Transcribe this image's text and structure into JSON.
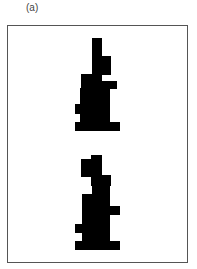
{
  "figure": {
    "panel_label": "(a)",
    "frame_color": "#555555",
    "shape_color": "#000000",
    "background_color": "#ffffff"
  },
  "shapes": [
    {
      "name": "upper-silhouette",
      "blocks": [
        {
          "x": 92,
          "y": 38,
          "w": 10,
          "h": 19
        },
        {
          "x": 92,
          "y": 56,
          "w": 19,
          "h": 19
        },
        {
          "x": 81,
          "y": 74,
          "w": 21,
          "h": 8
        },
        {
          "x": 81,
          "y": 81,
          "w": 36,
          "h": 8
        },
        {
          "x": 80,
          "y": 88,
          "w": 30,
          "h": 17
        },
        {
          "x": 75,
          "y": 104,
          "w": 35,
          "h": 10
        },
        {
          "x": 80,
          "y": 113,
          "w": 30,
          "h": 10
        },
        {
          "x": 75,
          "y": 122,
          "w": 45,
          "h": 9
        }
      ]
    },
    {
      "name": "lower-silhouette",
      "blocks": [
        {
          "x": 91,
          "y": 155,
          "w": 11,
          "h": 5
        },
        {
          "x": 81,
          "y": 159,
          "w": 21,
          "h": 18
        },
        {
          "x": 91,
          "y": 175,
          "w": 20,
          "h": 11
        },
        {
          "x": 92,
          "y": 185,
          "w": 18,
          "h": 10
        },
        {
          "x": 82,
          "y": 194,
          "w": 28,
          "h": 13
        },
        {
          "x": 82,
          "y": 206,
          "w": 38,
          "h": 9
        },
        {
          "x": 82,
          "y": 214,
          "w": 28,
          "h": 11
        },
        {
          "x": 75,
          "y": 224,
          "w": 35,
          "h": 9
        },
        {
          "x": 82,
          "y": 232,
          "w": 28,
          "h": 10
        },
        {
          "x": 75,
          "y": 241,
          "w": 45,
          "h": 9
        }
      ]
    }
  ]
}
